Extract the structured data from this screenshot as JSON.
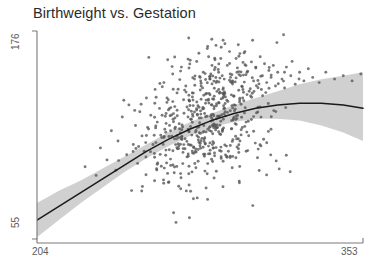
{
  "chart_data": {
    "type": "scatter",
    "title": "Birthweight vs. Gestation",
    "xlabel": "",
    "ylabel": "",
    "xlim": [
      204,
      353
    ],
    "ylim": [
      55,
      176
    ],
    "xticks": [
      204,
      353
    ],
    "yticks": [
      55,
      176
    ],
    "xticklabels": [
      "204",
      "353"
    ],
    "yticklabels": [
      "55",
      "176"
    ],
    "grid": false,
    "legend": null,
    "point_color": "#555555",
    "point_size": 2,
    "point_opacity": 0.78,
    "n_points": 620,
    "smoother": {
      "name": "loess fit",
      "color": "#1a1a1a",
      "line_width": 1.4,
      "band_name": "confidence band",
      "band_color": "#c9c9c9",
      "band_opacity": 0.85,
      "x": [
        204,
        214,
        224,
        234,
        244,
        254,
        264,
        274,
        284,
        294,
        304,
        314,
        324,
        334,
        344,
        353
      ],
      "y": [
        66,
        74,
        82,
        90,
        98,
        106,
        113,
        119,
        124,
        128,
        131,
        133,
        134,
        134,
        133,
        131
      ],
      "y_lower": [
        56,
        66,
        76,
        85,
        94,
        102,
        109,
        115,
        120,
        123,
        125,
        125,
        124,
        121,
        117,
        112
      ],
      "y_upper": [
        76,
        83,
        89,
        96,
        103,
        110,
        117,
        123,
        128,
        133,
        137,
        141,
        145,
        148,
        150,
        152
      ]
    },
    "scatter_points": [
      [
        226,
        97
      ],
      [
        231,
        92
      ],
      [
        233,
        108
      ],
      [
        236,
        101
      ],
      [
        238,
        118
      ],
      [
        240,
        95
      ],
      [
        241,
        112
      ],
      [
        243,
        126
      ],
      [
        245,
        104
      ],
      [
        246,
        133
      ],
      [
        248,
        110
      ],
      [
        249,
        121
      ],
      [
        250,
        99
      ],
      [
        251,
        129
      ],
      [
        252,
        115
      ],
      [
        253,
        106
      ],
      [
        254,
        137
      ],
      [
        255,
        119
      ],
      [
        256,
        127
      ],
      [
        257,
        110
      ],
      [
        258,
        142
      ],
      [
        259,
        123
      ],
      [
        260,
        131
      ],
      [
        261,
        114
      ],
      [
        262,
        146
      ],
      [
        263,
        128
      ],
      [
        264,
        136
      ],
      [
        265,
        118
      ],
      [
        266,
        151
      ],
      [
        267,
        132
      ],
      [
        268,
        140
      ],
      [
        269,
        122
      ],
      [
        270,
        155
      ],
      [
        271,
        136
      ],
      [
        272,
        144
      ],
      [
        273,
        126
      ],
      [
        274,
        159
      ],
      [
        275,
        140
      ],
      [
        276,
        148
      ],
      [
        277,
        130
      ],
      [
        278,
        163
      ],
      [
        279,
        144
      ],
      [
        280,
        152
      ],
      [
        281,
        134
      ],
      [
        282,
        167
      ],
      [
        283,
        148
      ],
      [
        284,
        156
      ],
      [
        285,
        138
      ],
      [
        286,
        125
      ],
      [
        287,
        152
      ],
      [
        288,
        160
      ],
      [
        289,
        142
      ],
      [
        290,
        129
      ],
      [
        291,
        156
      ],
      [
        292,
        164
      ],
      [
        293,
        146
      ],
      [
        294,
        133
      ],
      [
        295,
        160
      ],
      [
        296,
        168
      ],
      [
        297,
        150
      ],
      [
        298,
        137
      ],
      [
        299,
        164
      ],
      [
        300,
        152
      ],
      [
        301,
        141
      ],
      [
        302,
        158
      ],
      [
        303,
        147
      ],
      [
        304,
        155
      ],
      [
        305,
        143
      ],
      [
        306,
        161
      ],
      [
        307,
        150
      ],
      [
        308,
        157
      ],
      [
        309,
        146
      ],
      [
        310,
        153
      ],
      [
        311,
        149
      ],
      [
        312,
        156
      ],
      [
        313,
        144
      ],
      [
        314,
        152
      ],
      [
        316,
        148
      ],
      [
        318,
        155
      ],
      [
        320,
        150
      ],
      [
        322,
        145
      ],
      [
        324,
        152
      ],
      [
        326,
        147
      ],
      [
        328,
        154
      ],
      [
        330,
        149
      ],
      [
        333,
        146
      ],
      [
        336,
        152
      ],
      [
        340,
        148
      ],
      [
        344,
        150
      ],
      [
        348,
        147
      ],
      [
        352,
        151
      ]
    ]
  }
}
